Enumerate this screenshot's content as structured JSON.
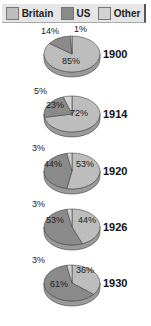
{
  "legend": [
    {
      "label": "Britain",
      "color": "#bdbdbd"
    },
    {
      "label": "US",
      "color": "#8a8a8a"
    },
    {
      "label": "Other",
      "color": "#d2d2d2"
    }
  ],
  "chart_data": {
    "type": "pie",
    "title": "",
    "series_names": [
      "Britain",
      "US",
      "Other"
    ],
    "charts": [
      {
        "year": "1900",
        "Britain": 85,
        "US": 14,
        "Other": 1,
        "labels": [
          "85%",
          "14%",
          "1%"
        ]
      },
      {
        "year": "1914",
        "Britain": 72,
        "US": 23,
        "Other": 5,
        "labels": [
          "72%",
          "23%",
          "5%"
        ]
      },
      {
        "year": "1920",
        "Britain": 53,
        "US": 44,
        "Other": 3,
        "labels": [
          "53%",
          "44%",
          "3%"
        ]
      },
      {
        "year": "1926",
        "Britain": 44,
        "US": 53,
        "Other": 3,
        "labels": [
          "44%",
          "53%",
          "3%"
        ]
      },
      {
        "year": "1930",
        "Britain": 36,
        "US": 61,
        "Other": 3,
        "labels": [
          "36%",
          "61%",
          "3%"
        ]
      }
    ]
  }
}
